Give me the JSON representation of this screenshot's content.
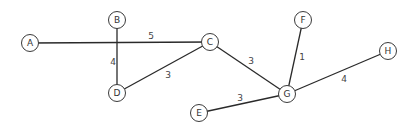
{
  "graph": {
    "type": "weighted-undirected-graph",
    "nodes": [
      {
        "id": "A",
        "label": "A",
        "x": 30,
        "y": 43
      },
      {
        "id": "B",
        "label": "B",
        "x": 117,
        "y": 20
      },
      {
        "id": "C",
        "label": "C",
        "x": 210,
        "y": 42
      },
      {
        "id": "D",
        "label": "D",
        "x": 117,
        "y": 93
      },
      {
        "id": "E",
        "label": "E",
        "x": 199,
        "y": 113
      },
      {
        "id": "F",
        "label": "F",
        "x": 303,
        "y": 20
      },
      {
        "id": "G",
        "label": "G",
        "x": 287,
        "y": 94
      },
      {
        "id": "H",
        "label": "H",
        "x": 388,
        "y": 51
      }
    ],
    "edges": [
      {
        "from": "A",
        "to": "C",
        "weight": "5",
        "lx": 151,
        "ly": 36
      },
      {
        "from": "B",
        "to": "D",
        "weight": "4",
        "lx": 113,
        "ly": 62
      },
      {
        "from": "D",
        "to": "C",
        "weight": "3",
        "lx": 168,
        "ly": 75
      },
      {
        "from": "C",
        "to": "G",
        "weight": "3",
        "lx": 251,
        "ly": 61
      },
      {
        "from": "F",
        "to": "G",
        "weight": "1",
        "lx": 302,
        "ly": 57
      },
      {
        "from": "G",
        "to": "H",
        "weight": "4",
        "lx": 344,
        "ly": 79
      },
      {
        "from": "E",
        "to": "G",
        "weight": "3",
        "lx": 240,
        "ly": 98
      }
    ]
  }
}
